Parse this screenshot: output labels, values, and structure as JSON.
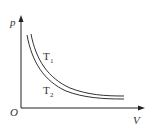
{
  "diagram": {
    "axes": {
      "y_label": "p",
      "x_label": "V",
      "origin_label": "O"
    },
    "curves": [
      {
        "name": "T1",
        "label_main": "T",
        "label_sub": "1"
      },
      {
        "name": "T2",
        "label_main": "T",
        "label_sub": "2"
      }
    ],
    "colors": {
      "axis": "#222222",
      "curve": "#333333",
      "background": "#ffffff"
    }
  }
}
